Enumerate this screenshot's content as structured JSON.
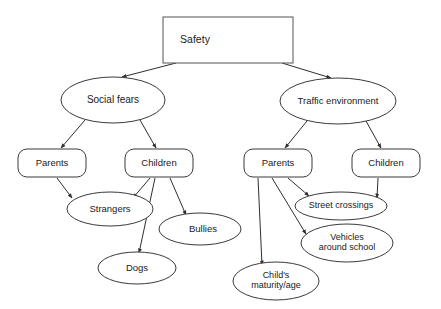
{
  "diagram": {
    "background_color": "#ffffff",
    "stroke_color": "#2e2e2e",
    "text_color": "#1a1a1a",
    "nodes": [
      {
        "id": "safety",
        "label": "Safety",
        "shape": "rectangle",
        "x": 228,
        "y": 40,
        "w": 130,
        "h": 46,
        "label_x": 195,
        "label_y": 40,
        "font_size": 10.5
      },
      {
        "id": "social_fears",
        "label": "Social fears",
        "shape": "ellipse",
        "x": 113,
        "y": 100,
        "w": 104,
        "h": 46,
        "label_x": 113,
        "label_y": 100,
        "font_size": 10
      },
      {
        "id": "traffic_environment",
        "label": "Traffic environment",
        "shape": "ellipse",
        "x": 338,
        "y": 101,
        "w": 116,
        "h": 46,
        "label_x": 338,
        "label_y": 101,
        "font_size": 9.5
      },
      {
        "id": "social_parents",
        "label": "Parents",
        "shape": "rounded-rect",
        "x": 52,
        "y": 163,
        "w": 68,
        "h": 28,
        "label_x": 52,
        "label_y": 163,
        "font_size": 9.5
      },
      {
        "id": "social_children",
        "label": "Children",
        "shape": "rounded-rect",
        "x": 159,
        "y": 163,
        "w": 68,
        "h": 28,
        "label_x": 159,
        "label_y": 163,
        "font_size": 9.5
      },
      {
        "id": "traffic_parents",
        "label": "Parents",
        "shape": "rounded-rect",
        "x": 278,
        "y": 163,
        "w": 68,
        "h": 28,
        "label_x": 278,
        "label_y": 163,
        "font_size": 9.5
      },
      {
        "id": "traffic_children",
        "label": "Children",
        "shape": "rounded-rect",
        "x": 386,
        "y": 163,
        "w": 68,
        "h": 28,
        "label_x": 386,
        "label_y": 163,
        "font_size": 9.5
      },
      {
        "id": "strangers",
        "label": "Strangers",
        "shape": "ellipse",
        "x": 110,
        "y": 209,
        "w": 86,
        "h": 34,
        "label_x": 110,
        "label_y": 209,
        "font_size": 9.5
      },
      {
        "id": "bullies",
        "label": "Bullies",
        "shape": "ellipse",
        "x": 200,
        "y": 229,
        "w": 82,
        "h": 32,
        "label_x": 203,
        "label_y": 229,
        "font_size": 9.5
      },
      {
        "id": "dogs",
        "label": "Dogs",
        "shape": "ellipse",
        "x": 137,
        "y": 268,
        "w": 78,
        "h": 32,
        "label_x": 137,
        "label_y": 268,
        "font_size": 9.5
      },
      {
        "id": "street_crossings",
        "label": "Street crossings",
        "shape": "ellipse",
        "x": 341,
        "y": 206,
        "w": 92,
        "h": 28,
        "label_x": 341,
        "label_y": 206,
        "font_size": 9
      },
      {
        "id": "vehicles_around_school",
        "label": "Vehicles around school",
        "label_line1": "Vehicles",
        "label_line2": "around school",
        "shape": "ellipse",
        "x": 347,
        "y": 243,
        "w": 92,
        "h": 38,
        "label_x": 347,
        "label_y": 243,
        "font_size": 9
      },
      {
        "id": "childs_maturity_age",
        "label": "Child's maturity/age",
        "label_line1": "Child's",
        "label_line2": "maturity/age",
        "shape": "ellipse",
        "x": 276,
        "y": 281,
        "w": 86,
        "h": 38,
        "label_x": 276,
        "label_y": 281,
        "font_size": 9
      }
    ],
    "edges": [
      {
        "id": "safety-social_fears",
        "from": "Safety",
        "to": "Social fears",
        "path": "M 176 63 L 122 77"
      },
      {
        "id": "safety-traffic_environment",
        "from": "Safety",
        "to": "Traffic environment",
        "path": "M 282 63 L 331 78"
      },
      {
        "id": "social_fears-social_parents",
        "from": "Social fears",
        "to": "Parents",
        "path": "M 85 120 L 61 148"
      },
      {
        "id": "social_fears-social_children",
        "from": "Social fears",
        "to": "Children",
        "path": "M 140 120 L 156 148"
      },
      {
        "id": "social_parents-strangers",
        "from": "Parents",
        "to": "Strangers",
        "path": "M 57 178 L 72 198"
      },
      {
        "id": "social_children-strangers",
        "from": "Children",
        "to": "Strangers",
        "path": "M 150 178 L 133 198"
      },
      {
        "id": "social_children-bullies",
        "from": "Children",
        "to": "Bullies",
        "path": "M 170 178 L 186 215"
      },
      {
        "id": "social_children-dogs",
        "from": "Children",
        "to": "Dogs",
        "path": "M 155 178 L 139 253"
      },
      {
        "id": "traffic_environment-traffic_parents",
        "from": "Traffic environment",
        "to": "Parents",
        "path": "M 307 121 L 285 148"
      },
      {
        "id": "traffic_environment-traffic_children",
        "from": "Traffic environment",
        "to": "Children",
        "path": "M 366 121 L 381 148"
      },
      {
        "id": "traffic_parents-street_crossings",
        "from": "Parents",
        "to": "Street crossings",
        "path": "M 288 178 L 309 196"
      },
      {
        "id": "traffic_parents-vehicles",
        "from": "Parents",
        "to": "Vehicles around school",
        "path": "M 272 178 L 306 234"
      },
      {
        "id": "traffic_parents-childs_maturity",
        "from": "Parents",
        "to": "Child's maturity/age",
        "path": "M 258 178 L 262 265"
      },
      {
        "id": "traffic_children-street_crossings",
        "from": "Children",
        "to": "Street crossings",
        "path": "M 378 178 L 377 198"
      }
    ]
  }
}
